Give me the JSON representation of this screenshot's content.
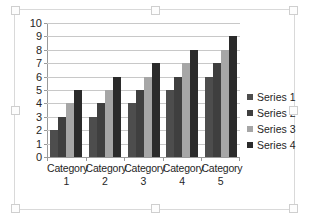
{
  "chart_data": {
    "type": "bar",
    "title": "",
    "subtitle": "",
    "xlabel": "",
    "ylabel": "",
    "ylim": [
      0,
      10
    ],
    "y_ticks": [
      "0",
      "1",
      "2",
      "3",
      "4",
      "5",
      "6",
      "7",
      "8",
      "9",
      "10"
    ],
    "grid": true,
    "legend_position": "right",
    "categories": [
      "Category 1",
      "Category 2",
      "Category 3",
      "Category 4",
      "Category 5"
    ],
    "category_lines": [
      {
        "word": "Category",
        "num": "1"
      },
      {
        "word": "Category",
        "num": "2"
      },
      {
        "word": "Category",
        "num": "3"
      },
      {
        "word": "Category",
        "num": "4"
      },
      {
        "word": "Category",
        "num": "5"
      }
    ],
    "series": [
      {
        "name": "Series 1",
        "color": "#4d4d4d",
        "values": [
          2,
          3,
          4,
          5,
          6
        ]
      },
      {
        "name": "Series 2",
        "color": "#3f3f3f",
        "values": [
          3,
          4,
          5,
          6,
          7
        ]
      },
      {
        "name": "Series 3",
        "color": "#a6a6a6",
        "values": [
          4,
          5,
          6,
          7,
          8
        ]
      },
      {
        "name": "Series 4",
        "color": "#2b2b2b",
        "values": [
          5,
          6,
          7,
          8,
          9
        ]
      }
    ]
  },
  "colors": {
    "plot_background": "#ffffff",
    "gridline": "#c8c8c8",
    "axis": "#9a9a9a",
    "chart_border": "#d9d9d9",
    "text": "#262626"
  },
  "selection": {
    "handles": [
      "top-left",
      "top-center",
      "top-right",
      "middle-left",
      "middle-right",
      "bottom-left",
      "bottom-center",
      "bottom-right"
    ]
  }
}
